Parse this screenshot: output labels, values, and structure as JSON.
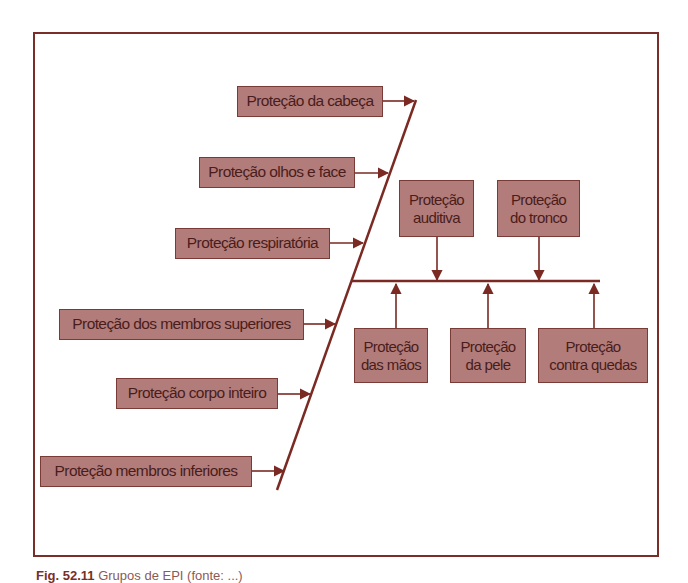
{
  "diagram": {
    "type": "ishikawa-fishbone",
    "colors": {
      "line": "#7a2a22",
      "box_fill": "#b27c7a",
      "box_border": "#7a3a36",
      "text": "#4a1c1a",
      "frame": "#7a2e28"
    },
    "left_branches": [
      {
        "label": "Proteção da cabeça"
      },
      {
        "label": "Proteção olhos e face"
      },
      {
        "label": "Proteção respiratória"
      },
      {
        "label": "Proteção dos membros superiores"
      },
      {
        "label": "Proteção corpo inteiro"
      },
      {
        "label": "Proteção membros inferiores"
      }
    ],
    "top_branches": [
      {
        "line1": "Proteção",
        "line2": "auditiva"
      },
      {
        "line1": "Proteção",
        "line2": "do tronco"
      }
    ],
    "bottom_branches": [
      {
        "line1": "Proteção",
        "line2": "das mãos"
      },
      {
        "line1": "Proteção",
        "line2": "da pele"
      },
      {
        "line1": "Proteção",
        "line2": "contra quedas"
      }
    ]
  },
  "caption": {
    "fig": "Fig. 52.11",
    "text": "Grupos de EPI (fonte: ...)"
  }
}
